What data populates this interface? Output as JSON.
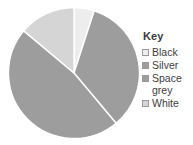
{
  "legend": {
    "title": "Key",
    "position": "right",
    "entries": [
      {
        "label": "Black",
        "color": "#ededed"
      },
      {
        "label": "Silver",
        "color": "#9d9d9d"
      },
      {
        "label": "Space grey",
        "color": "#9d9d9d"
      },
      {
        "label": "White",
        "color": "#d5d5d5"
      }
    ]
  },
  "chart_data": {
    "type": "pie",
    "title": "",
    "subtitle": "",
    "xlabel": "",
    "ylabel": "",
    "grid": false,
    "legend_position": "right",
    "start_angle": 0,
    "direction": "clockwise",
    "categories": [
      "Black",
      "Silver",
      "Space grey",
      "White"
    ],
    "values": [
      5,
      34,
      47,
      14
    ],
    "units": "percent",
    "colors": [
      "#ededed",
      "#9d9d9d",
      "#9d9d9d",
      "#d5d5d5"
    ],
    "slice_border_color": "#ffffff",
    "slices": [
      {
        "label": "Black",
        "value": 5,
        "start_deg": 0,
        "end_deg": 18,
        "color": "#ededed"
      },
      {
        "label": "Silver",
        "value": 34,
        "start_deg": 18,
        "end_deg": 140,
        "color": "#9d9d9d"
      },
      {
        "label": "Space grey",
        "value": 47,
        "start_deg": 140,
        "end_deg": 310,
        "color": "#9d9d9d"
      },
      {
        "label": "White",
        "value": 14,
        "start_deg": 310,
        "end_deg": 360,
        "color": "#d5d5d5"
      }
    ]
  }
}
